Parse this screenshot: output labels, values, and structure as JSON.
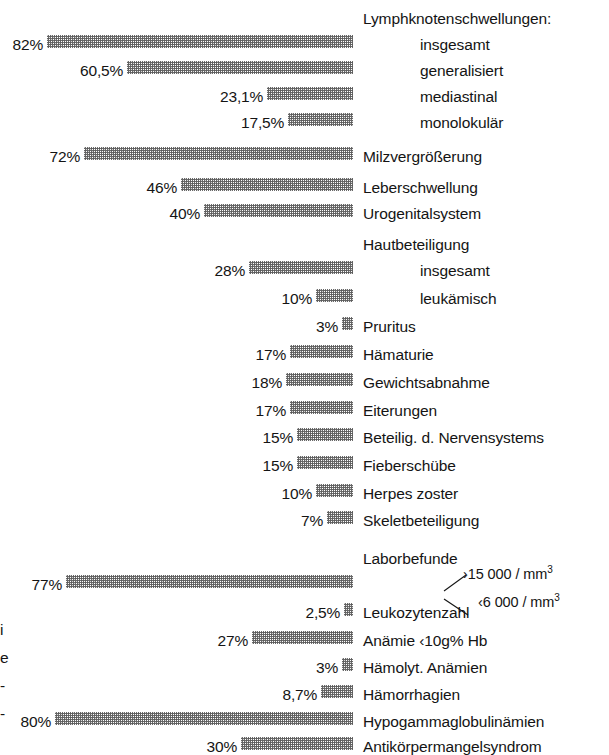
{
  "figure": {
    "bar_scale_px_per_percent": 3.73,
    "bar_right_edge_px": 353,
    "label_left_px": 363,
    "indent_left_px": 420,
    "bar_fill_color": "#8c8c8c",
    "text_color": "#141414",
    "background_color": "#ffffff"
  },
  "chart_data": {
    "type": "bar",
    "orientation": "horizontal-right-aligned",
    "title": "",
    "xlabel": "",
    "ylabel": "",
    "xlim": [
      0,
      100
    ],
    "grid": false,
    "legend": false,
    "value_suffix": "%",
    "categories": [
      "Lymphknotenschwellungen: insgesamt",
      "Lymphknotenschwellungen: generalisiert",
      "Lymphknotenschwellungen: mediastinal",
      "Lymphknotenschwellungen: monolokulär",
      "Milzvergrößerung",
      "Leberschwellung",
      "Urogenitalsystem",
      "Hautbeteiligung insgesamt",
      "Hautbeteiligung leukämisch",
      "Pruritus",
      "Hämaturie",
      "Gewichtsabnahme",
      "Eiterungen",
      "Beteilig. d. Nervensystems",
      "Fieberschübe",
      "Herpes zoster",
      "Skeletbeteiligung",
      "Leukozytenzahl ›15 000/mm³",
      "Leukozytenzahl ‹6 000/mm³",
      "Anämie ‹10g% Hb",
      "Hämolyt. Anämien",
      "Hämorrhagien",
      "Hypogammaglobulinämien",
      "Antikörpermangelsyndrom"
    ],
    "values": [
      82,
      60.5,
      23.1,
      17.5,
      72,
      46,
      40,
      28,
      10,
      3,
      17,
      18,
      17,
      15,
      15,
      10,
      7,
      77,
      2.5,
      27,
      3,
      8.7,
      80,
      30
    ]
  },
  "rows": [
    {
      "kind": "heading",
      "label": "Lymphknotenschwellungen:",
      "indent": false,
      "y": 5
    },
    {
      "kind": "bar",
      "label": "insgesamt",
      "indent": true,
      "value": 82,
      "value_text": "82%",
      "y": 31
    },
    {
      "kind": "bar",
      "label": "generalisiert",
      "indent": true,
      "value": 60.5,
      "value_text": "60,5%",
      "y": 57
    },
    {
      "kind": "bar",
      "label": "mediastinal",
      "indent": true,
      "value": 23.1,
      "value_text": "23,1%",
      "y": 83
    },
    {
      "kind": "bar",
      "label": "monolokulär",
      "indent": true,
      "value": 17.5,
      "value_text": "17,5%",
      "y": 109
    },
    {
      "kind": "bar",
      "label": "Milzvergrößerung",
      "indent": false,
      "value": 72,
      "value_text": "72%",
      "y": 143
    },
    {
      "kind": "bar",
      "label": "Leberschwellung",
      "indent": false,
      "value": 46,
      "value_text": "46%",
      "y": 174
    },
    {
      "kind": "bar",
      "label": "Urogenitalsystem",
      "indent": false,
      "value": 40,
      "value_text": "40%",
      "y": 200
    },
    {
      "kind": "heading",
      "label": "Hautbeteiligung",
      "indent": false,
      "y": 231
    },
    {
      "kind": "bar",
      "label": "insgesamt",
      "indent": true,
      "value": 28,
      "value_text": "28%",
      "y": 257
    },
    {
      "kind": "bar",
      "label": "leukämisch",
      "indent": true,
      "value": 10,
      "value_text": "10%",
      "y": 285
    },
    {
      "kind": "bar",
      "label": "Pruritus",
      "indent": false,
      "value": 3,
      "value_text": "3%",
      "y": 313
    },
    {
      "kind": "bar",
      "label": "Hämaturie",
      "indent": false,
      "value": 17,
      "value_text": "17%",
      "y": 341
    },
    {
      "kind": "bar",
      "label": "Gewichtsabnahme",
      "indent": false,
      "value": 18,
      "value_text": "18%",
      "y": 369
    },
    {
      "kind": "bar",
      "label": "Eiterungen",
      "indent": false,
      "value": 17,
      "value_text": "17%",
      "y": 397
    },
    {
      "kind": "bar",
      "label": "Beteilig. d. Nervensystems",
      "indent": false,
      "value": 15,
      "value_text": "15%",
      "y": 424
    },
    {
      "kind": "bar",
      "label": "Fieberschübe",
      "indent": false,
      "value": 15,
      "value_text": "15%",
      "y": 452
    },
    {
      "kind": "bar",
      "label": "Herpes zoster",
      "indent": false,
      "value": 10,
      "value_text": "10%",
      "y": 480
    },
    {
      "kind": "bar",
      "label": "Skeletbeteiligung",
      "indent": false,
      "value": 7,
      "value_text": "7%",
      "y": 507
    },
    {
      "kind": "heading",
      "label": "Laborbefunde",
      "indent": false,
      "y": 545
    },
    {
      "kind": "bar",
      "label": "",
      "indent": false,
      "value": 77,
      "value_text": "77%",
      "y": 571
    },
    {
      "kind": "bar",
      "label": "Leukozytenzahl",
      "indent": false,
      "value": 2.5,
      "value_text": "2,5%",
      "y": 599
    },
    {
      "kind": "bar",
      "label": "Anämie ‹10g% Hb",
      "indent": false,
      "value": 27,
      "value_text": "27%",
      "y": 627
    },
    {
      "kind": "bar",
      "label": "Hämolyt. Anämien",
      "indent": false,
      "value": 3,
      "value_text": "3%",
      "y": 654
    },
    {
      "kind": "bar",
      "label": "Hämorrhagien",
      "indent": false,
      "value": 8.7,
      "value_text": "8,7%",
      "y": 681
    },
    {
      "kind": "bar",
      "label": "Hypogammaglobulinämien",
      "indent": false,
      "value": 80,
      "value_text": "80%",
      "y": 708
    },
    {
      "kind": "bar",
      "label": "Antikörpermangelsyndrom",
      "indent": false,
      "value": 30,
      "value_text": "30%",
      "y": 733
    }
  ],
  "annotations": {
    "upper": {
      "prefix": "›",
      "number": "15 000",
      "unit": "/ mm",
      "exponent": "3",
      "x": 463,
      "y": 567
    },
    "lower": {
      "prefix": "‹",
      "number": "6 000",
      "unit": "/ mm",
      "exponent": "3",
      "x": 478,
      "y": 595
    }
  },
  "margin_fragments": [
    {
      "text": "i",
      "y": 622
    },
    {
      "text": "e",
      "y": 650
    },
    {
      "text": "-",
      "y": 678
    },
    {
      "text": "-",
      "y": 706
    }
  ]
}
